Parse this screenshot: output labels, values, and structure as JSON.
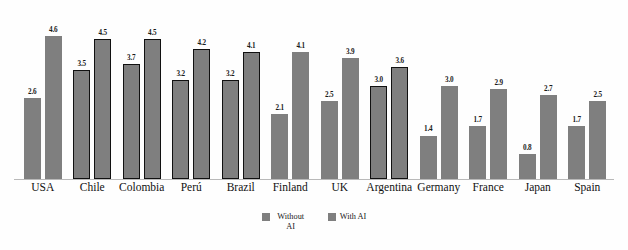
{
  "chart_data": {
    "type": "bar",
    "title": "",
    "subtitle": "",
    "xlabel": "",
    "ylabel": "",
    "ylim": [
      0,
      4.9
    ],
    "grid": false,
    "legend_position": "bottom",
    "categories": [
      "USA",
      "Chile",
      "Colombia",
      "Perú",
      "Brazil",
      "Finland",
      "UK",
      "Argentina",
      "Germany",
      "France",
      "Japan",
      "Spain"
    ],
    "series": [
      {
        "name": "Without AI",
        "color": "#7f7f7f",
        "values": [
          2.6,
          3.5,
          3.7,
          3.2,
          3.2,
          2.1,
          2.5,
          3.0,
          1.4,
          1.7,
          0.8,
          1.7
        ],
        "labels": [
          "2.6",
          "3.5",
          "3.7",
          "3.2",
          "3.2",
          "2.1",
          "2.5",
          "3.0",
          "1.4",
          "1.7",
          "0.8",
          "1.7"
        ]
      },
      {
        "name": "With AI",
        "color": "#7f7f7f",
        "values": [
          4.6,
          4.5,
          4.5,
          4.2,
          4.1,
          4.1,
          3.9,
          3.6,
          3.0,
          2.9,
          2.7,
          2.5
        ],
        "labels": [
          "4.6",
          "4.5",
          "4.5",
          "4.2",
          "4.1",
          "4.1",
          "3.9",
          "3.6",
          "3.0",
          "2.9",
          "2.7",
          "2.5"
        ]
      }
    ],
    "highlighted_categories": [
      "Chile",
      "Colombia",
      "Perú",
      "Brazil",
      "Argentina"
    ],
    "annotations": []
  },
  "legend": {
    "entries": [
      {
        "label": "Without AI"
      },
      {
        "label": "With AI"
      }
    ]
  }
}
